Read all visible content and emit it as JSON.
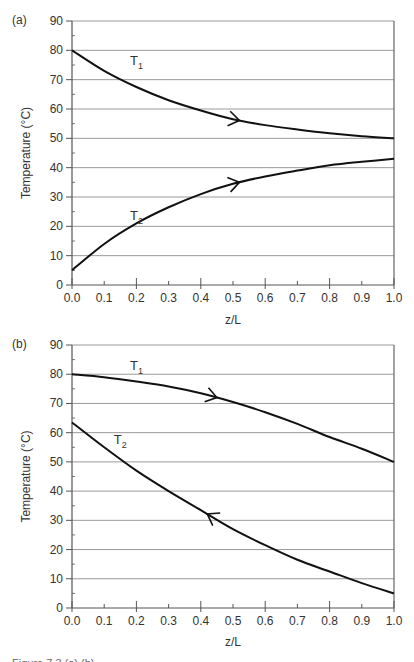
{
  "chart_data": [
    {
      "type": "line",
      "panel": "(a)",
      "title": "",
      "xlabel": "z/L",
      "ylabel": "Temperature (°C)",
      "xlim": [
        0.0,
        1.0
      ],
      "ylim": [
        0,
        90
      ],
      "x": [
        0.0,
        0.1,
        0.2,
        0.3,
        0.4,
        0.5,
        0.6,
        0.7,
        0.8,
        0.9,
        1.0
      ],
      "x_tick_labels": [
        "0.0",
        "0.1",
        "0.2",
        "0.3",
        "0.4",
        "0.5",
        "0.6",
        "0.7",
        "0.8",
        "0.9",
        "1.0"
      ],
      "y_tick_labels": [
        "0",
        "10",
        "20",
        "30",
        "40",
        "50",
        "60",
        "70",
        "80",
        "90"
      ],
      "grid": "horizontal",
      "series": [
        {
          "name": "T1",
          "label_main": "T",
          "label_sub": "1",
          "values": [
            80,
            73,
            67.5,
            63,
            59.5,
            56.5,
            54.5,
            53,
            51.7,
            50.7,
            50
          ],
          "arrow_at": 0.52,
          "arrow_direction": "right",
          "label_pos": {
            "x": 0.18,
            "y": 75
          }
        },
        {
          "name": "T2",
          "label_main": "T",
          "label_sub": "2",
          "values": [
            5,
            14,
            21,
            26.5,
            31,
            34.5,
            37,
            39,
            40.8,
            42,
            43
          ],
          "arrow_at": 0.52,
          "arrow_direction": "right",
          "label_pos": {
            "x": 0.18,
            "y": 22
          }
        }
      ]
    },
    {
      "type": "line",
      "panel": "(b)",
      "title": "",
      "xlabel": "z/L",
      "ylabel": "Temperature (°C)",
      "xlim": [
        0.0,
        1.0
      ],
      "ylim": [
        0,
        90
      ],
      "x": [
        0.0,
        0.1,
        0.2,
        0.3,
        0.4,
        0.5,
        0.6,
        0.7,
        0.8,
        0.9,
        1.0
      ],
      "x_tick_labels": [
        "0.0",
        "0.1",
        "0.2",
        "0.3",
        "0.4",
        "0.5",
        "0.6",
        "0.7",
        "0.8",
        "0.9",
        "1.0"
      ],
      "y_tick_labels": [
        "0",
        "10",
        "20",
        "30",
        "40",
        "50",
        "60",
        "70",
        "80",
        "90"
      ],
      "grid": "horizontal",
      "series": [
        {
          "name": "T1",
          "label_main": "T",
          "label_sub": "1",
          "values": [
            80,
            79,
            77.5,
            75.8,
            73.5,
            70.5,
            67,
            63,
            58.5,
            54.5,
            50
          ],
          "arrow_at": 0.45,
          "arrow_direction": "right",
          "label_pos": {
            "x": 0.18,
            "y": 81.5
          }
        },
        {
          "name": "T2",
          "label_main": "T",
          "label_sub": "2",
          "values": [
            63.5,
            55,
            47,
            40,
            33.5,
            27,
            21.5,
            16.5,
            12.5,
            8.5,
            5
          ],
          "arrow_at": 0.42,
          "arrow_direction": "left",
          "label_pos": {
            "x": 0.13,
            "y": 56
          }
        }
      ]
    }
  ],
  "panels": [
    {
      "label": "(a)",
      "xlabel": "z/L",
      "ylabel": "Temperature (°C)"
    },
    {
      "label": "(b)",
      "xlabel": "z/L",
      "ylabel": "Temperature (°C)"
    }
  ],
  "caption": "Figure 7.3 (a) (b) ..."
}
